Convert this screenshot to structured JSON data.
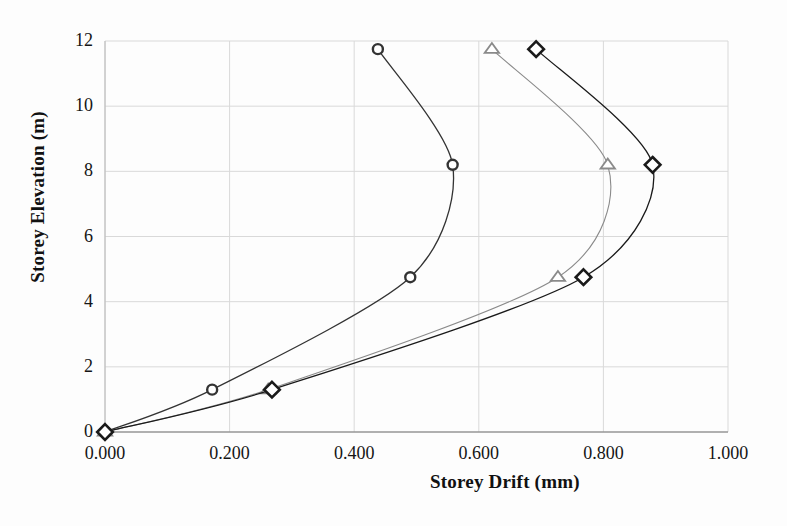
{
  "chart_data": {
    "type": "line",
    "title": "",
    "xlabel": "Storey Drift (mm)",
    "ylabel": "Storey Elevation (m)",
    "xlim": [
      0.0,
      1.0
    ],
    "ylim": [
      0,
      12
    ],
    "xticks": [
      "0.000",
      "0.200",
      "0.400",
      "0.600",
      "0.800",
      "1.000"
    ],
    "xtick_values": [
      0.0,
      0.2,
      0.4,
      0.6,
      0.8,
      1.0
    ],
    "yticks": [
      "0",
      "2",
      "4",
      "6",
      "8",
      "10",
      "12"
    ],
    "ytick_values": [
      0,
      2,
      4,
      6,
      8,
      10,
      12
    ],
    "grid": true,
    "legend": "none",
    "series": [
      {
        "name": "series-circle",
        "marker": "circle",
        "color": "#333333",
        "points": [
          {
            "x": 0.0,
            "y": 0.0
          },
          {
            "x": 0.172,
            "y": 1.3
          },
          {
            "x": 0.49,
            "y": 4.75
          },
          {
            "x": 0.558,
            "y": 8.2
          },
          {
            "x": 0.438,
            "y": 11.75
          }
        ]
      },
      {
        "name": "series-triangle",
        "marker": "triangle",
        "color": "#8a8a8a",
        "points": [
          {
            "x": 0.0,
            "y": 0.0
          },
          {
            "x": 0.262,
            "y": 1.3
          },
          {
            "x": 0.727,
            "y": 4.75
          },
          {
            "x": 0.807,
            "y": 8.2
          },
          {
            "x": 0.621,
            "y": 11.75
          }
        ]
      },
      {
        "name": "series-diamond",
        "marker": "diamond",
        "color": "#1a1a1a",
        "points": [
          {
            "x": 0.0,
            "y": 0.0
          },
          {
            "x": 0.268,
            "y": 1.3
          },
          {
            "x": 0.768,
            "y": 4.75
          },
          {
            "x": 0.879,
            "y": 8.2
          },
          {
            "x": 0.692,
            "y": 11.75
          }
        ]
      }
    ]
  },
  "style": {
    "grid_color": "#d9d9d9",
    "axis_color": "#b8b8b8",
    "background": "#fdfdfd"
  }
}
